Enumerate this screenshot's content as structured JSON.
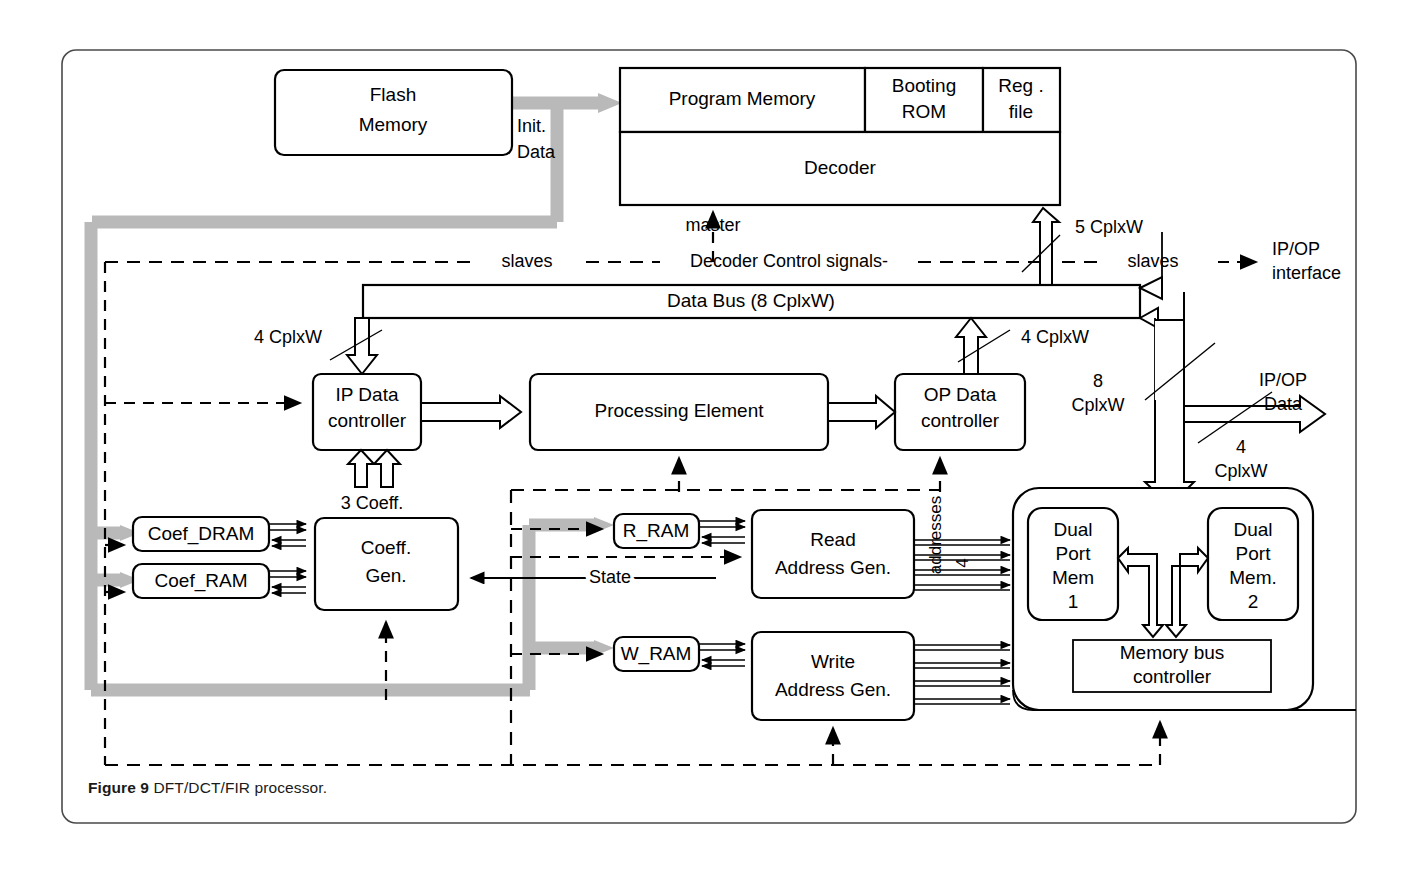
{
  "figure": {
    "caption_label": "Figure 9",
    "caption_text": " DFT/DCT/FIR processor."
  },
  "blocks": {
    "flash_memory_l1": "Flash",
    "flash_memory_l2": "Memory",
    "program_memory": "Program Memory",
    "booting_rom_l1": "Booting",
    "booting_rom_l2": "ROM",
    "reg_file_l1": "Reg .",
    "reg_file_l2": "file",
    "decoder": "Decoder",
    "data_bus": "Data Bus (8 CplxW)",
    "ip_data_controller_l1": "IP Data",
    "ip_data_controller_l2": "controller",
    "processing_element": "Processing Element",
    "op_data_controller_l1": "OP Data",
    "op_data_controller_l2": "controller",
    "coef_dram": "Coef_DRAM",
    "coef_ram": "Coef_RAM",
    "coeff_gen_l1": "Coeff.",
    "coeff_gen_l2": "Gen.",
    "r_ram": "R_RAM",
    "w_ram": "W_RAM",
    "read_addr_gen_l1": "Read",
    "read_addr_gen_l2": "Address Gen.",
    "write_addr_gen_l1": "Write",
    "write_addr_gen_l2": "Address Gen.",
    "dual_port_mem1_l1": "Dual",
    "dual_port_mem1_l2": "Port",
    "dual_port_mem1_l3": "Mem",
    "dual_port_mem1_l4": "1",
    "dual_port_mem2_l1": "Dual",
    "dual_port_mem2_l2": "Port",
    "dual_port_mem2_l3": "Mem.",
    "dual_port_mem2_l4": "2",
    "memory_bus_controller_l1": "Memory bus",
    "memory_bus_controller_l2": "controller"
  },
  "labels": {
    "init_data_l1": "Init.",
    "init_data_l2": "Data",
    "master": "master",
    "slaves_left": "slaves",
    "decoder_control_signals": "Decoder  Control signals-",
    "cplxw_5": "5 CplxW",
    "slaves_right": "slaves",
    "ipop_interface_l1": "IP/OP",
    "ipop_interface_l2": "interface",
    "cplxw_4_left": "4 CplxW",
    "cplxw_4_right": "4 CplxW",
    "cplxw_8_l1": "8",
    "cplxw_8_l2": "CplxW",
    "ipop_data_l1": "IP/OP",
    "ipop_data_l2": "Data",
    "cplxw_4_out_l1": "4",
    "cplxw_4_out_l2": "CplxW",
    "coeff_3": "3 Coeff.",
    "state": "State",
    "addresses": "addresses",
    "addr_width_4": "4"
  },
  "colors": {
    "line": "#000000",
    "gray_bus": "#b9b9b9",
    "frame": "#4a4a4a",
    "background": "#ffffff"
  }
}
